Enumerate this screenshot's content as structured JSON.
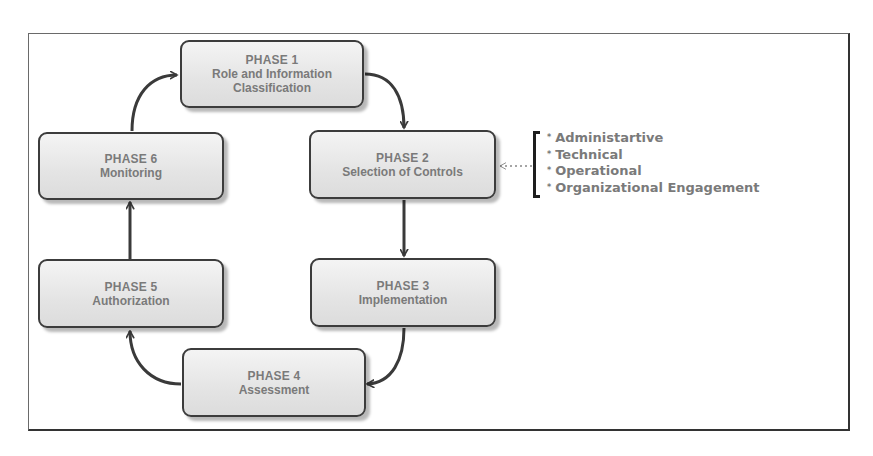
{
  "diagram": {
    "type": "cycle",
    "phases": [
      {
        "id": 1,
        "title": "PHASE 1",
        "lines": [
          "Role and Information",
          "Classification"
        ]
      },
      {
        "id": 2,
        "title": "PHASE 2",
        "lines": [
          "Selection of Controls"
        ]
      },
      {
        "id": 3,
        "title": "PHASE 3",
        "lines": [
          "Implementation"
        ]
      },
      {
        "id": 4,
        "title": "PHASE 4",
        "lines": [
          "Assessment"
        ]
      },
      {
        "id": 5,
        "title": "PHASE 5",
        "lines": [
          "Authorization"
        ]
      },
      {
        "id": 6,
        "title": "PHASE 6",
        "lines": [
          "Monitoring"
        ]
      }
    ],
    "flow": [
      "PHASE 1 -> PHASE 2",
      "PHASE 2 -> PHASE 3",
      "PHASE 3 -> PHASE 4",
      "PHASE 4 -> PHASE 5",
      "PHASE 5 -> PHASE 6",
      "PHASE 6 -> PHASE 1"
    ],
    "controls_annotation": {
      "target": "PHASE 2",
      "connector": "dotted-arrow",
      "bullet": "*",
      "items": [
        "Administartive",
        "Technical",
        "Operational",
        "Organizational Engagement"
      ]
    }
  },
  "colors": {
    "box_border": "#3c3c3c",
    "box_fill": "#e4e4e4",
    "text": "#7a7a7a",
    "arrow": "#3a3a3a",
    "frame": "#6a6a6a"
  }
}
